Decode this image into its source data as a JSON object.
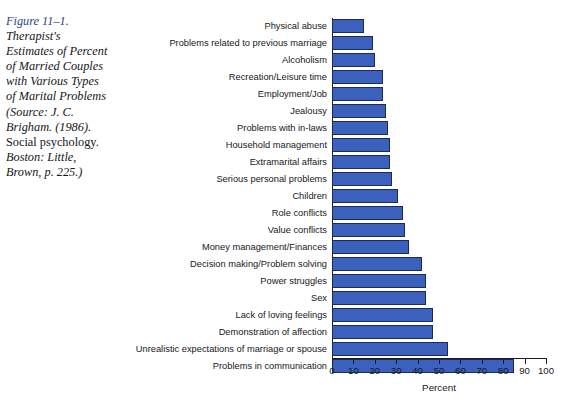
{
  "caption": {
    "figure_number": "Figure 11–1.",
    "lines": [
      "Therapist's",
      "Estimates of Percent",
      "of Married Couples",
      "with Various Types",
      "of Marital Problems",
      "(Source: J. C.",
      "Brigham. (1986).",
      "Social psychology.",
      "Boston: Little,",
      "Brown, p. 225.)"
    ],
    "full_text": "Figure 11–1. Therapist's Estimates of Percent of Married Couples with Various Types of Marital Problems (Source: J. C. Brigham. (1986). Social psychology. Boston: Little, Brown, p. 225.)",
    "figure_number_color": "#2d3f8f",
    "text_color": "#15161a"
  },
  "chart_data": {
    "type": "bar",
    "orientation": "horizontal",
    "title": "",
    "subtitle": "",
    "xlabel": "Percent",
    "ylabel": "",
    "xlim": [
      0,
      100
    ],
    "xticks": [
      0,
      10,
      20,
      30,
      40,
      50,
      60,
      70,
      80,
      90,
      100
    ],
    "xtick_labels": [
      "0",
      "10",
      "20",
      "30",
      "40",
      "50",
      "60",
      "70",
      "80",
      "90",
      "100"
    ],
    "grid": false,
    "legend": null,
    "bar_color": "#3b60bd",
    "bar_edge_color": "#1c2a58",
    "categories": [
      "Physical abuse",
      "Problems related to previous marriage",
      "Alcoholism",
      "Recreation/Leisure time",
      "Employment/Job",
      "Jealousy",
      "Problems with in-laws",
      "Household management",
      "Extramarital affairs",
      "Serious personal problems",
      "Children",
      "Role conflicts",
      "Value conflicts",
      "Money management/Finances",
      "Decision making/Problem solving",
      "Power struggles",
      "Sex",
      "Lack of loving feelings",
      "Demonstration of affection",
      "Unrealistic expectations of marriage or spouse",
      "Problems in communication"
    ],
    "values": [
      15,
      19,
      20,
      24,
      24,
      25,
      26,
      27,
      27,
      28,
      31,
      33,
      34,
      36,
      42,
      44,
      44,
      47,
      47,
      54,
      85
    ]
  }
}
